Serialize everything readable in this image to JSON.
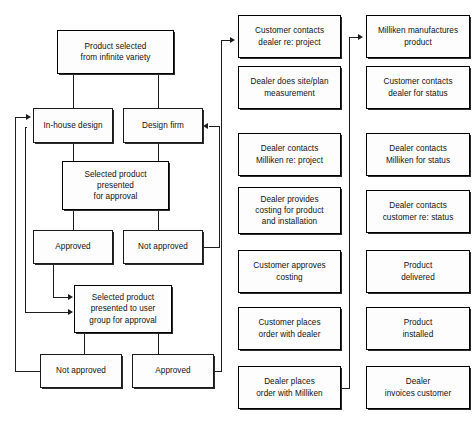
{
  "diagram": {
    "type": "flowchart",
    "title": "",
    "background_color": "#ffffff",
    "line_color": "#1d1d1d",
    "box_fill_color": "#fdfdfd",
    "box_border_color": "#1a1a1a",
    "columns": [
      {
        "name": "design-approval-process",
        "nodes": [
          "Product selected\nfrom infinite variety",
          "In-house design",
          "Design firm",
          "Selected product\npresented\nfor approval",
          "Approved",
          "Not approved",
          "Selected product\npresented to user\ngroup for approval",
          "Not approved",
          "Approved"
        ]
      },
      {
        "name": "order-process",
        "nodes": [
          "Customer contacts\ndealer re: project",
          "Dealer does site/plan\nmeasurement",
          "Dealer contacts\nMilliken re: project",
          "Dealer provides\ncosting for product\nand installation",
          "Customer approves\ncosting",
          "Customer places\norder with dealer",
          "Dealer places\norder with Milliken"
        ]
      },
      {
        "name": "fulfillment-process",
        "nodes": [
          "Milliken manufactures\nproduct",
          "Customer contacts\ndealer for status",
          "Dealer contacts\nMilliken for status",
          "Dealer contacts\ncustomer re: status",
          "Product\ndelivered",
          "Product\ninstalled",
          "Dealer\ninvoices customer"
        ]
      }
    ],
    "nodes": {
      "product_selected": "Product selected\nfrom infinite variety",
      "in_house_design": "In-house design",
      "design_firm": "Design firm",
      "selected_product_approval": "Selected product\npresented\nfor approval",
      "approved_1": "Approved",
      "not_approved_1": "Not approved",
      "selected_product_user_group": "Selected product\npresented to user\ngroup for approval",
      "not_approved_2": "Not approved",
      "approved_2": "Approved",
      "customer_contacts_dealer": "Customer contacts\ndealer re: project",
      "dealer_site_plan": "Dealer does site/plan\nmeasurement",
      "dealer_contacts_milliken": "Dealer contacts\nMilliken re: project",
      "dealer_provides_costing": "Dealer provides\ncosting for product\nand installation",
      "customer_approves_costing": "Customer approves\ncosting",
      "customer_places_order": "Customer places\norder with dealer",
      "dealer_places_order": "Dealer places\norder with Milliken",
      "milliken_manufactures": "Milliken manufactures\nproduct",
      "customer_contacts_status": "Customer contacts\ndealer for status",
      "dealer_contacts_milliken_status": "Dealer contacts\nMilliken for status",
      "dealer_contacts_customer_status": "Dealer contacts\ncustomer re: status",
      "product_delivered": "Product\ndelivered",
      "product_installed": "Product\ninstalled",
      "dealer_invoices": "Dealer\ninvoices customer"
    }
  }
}
